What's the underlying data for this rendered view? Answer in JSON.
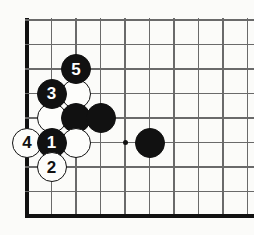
{
  "diagram": {
    "type": "go-board-diagram",
    "board": {
      "background_color": "#fbfbf9",
      "line_color": "#6a6a6a",
      "edge_color": "#111111",
      "origin_x": 27,
      "origin_y": 20,
      "spacing": 24.5,
      "columns": 10,
      "rows": 9,
      "left_edge_is_board_border": true,
      "bottom_edge_is_board_border": true,
      "top_edge_is_board_border": true,
      "star_points": [
        {
          "col": 4,
          "row": 5,
          "label": "hoshi"
        }
      ]
    },
    "stones": [
      {
        "id": "s-white-a",
        "color": "white",
        "label": "",
        "col": 2,
        "row": 3,
        "numbered": false
      },
      {
        "id": "s-white-b",
        "color": "white",
        "label": "",
        "col": 1,
        "row": 4,
        "numbered": false
      },
      {
        "id": "s-black-c",
        "color": "black",
        "label": "",
        "col": 2,
        "row": 4,
        "numbered": false
      },
      {
        "id": "s-black-d",
        "color": "black",
        "label": "",
        "col": 3,
        "row": 4,
        "numbered": false
      },
      {
        "id": "s-white-e",
        "color": "white",
        "label": "",
        "col": 2,
        "row": 5,
        "numbered": false
      },
      {
        "id": "s-black-f",
        "color": "black",
        "label": "",
        "col": 5,
        "row": 5,
        "numbered": false
      },
      {
        "id": "move-3",
        "color": "black",
        "label": "3",
        "col": 1,
        "row": 3,
        "numbered": true
      },
      {
        "id": "move-5",
        "color": "black",
        "label": "5",
        "col": 2,
        "row": 2,
        "numbered": true
      },
      {
        "id": "move-4",
        "color": "white",
        "label": "4",
        "col": 0,
        "row": 5,
        "numbered": true
      },
      {
        "id": "move-1",
        "color": "black",
        "label": "1",
        "col": 1,
        "row": 5,
        "numbered": true
      },
      {
        "id": "move-2",
        "color": "white",
        "label": "2",
        "col": 1,
        "row": 6,
        "numbered": true
      }
    ],
    "move_sequence": [
      "1",
      "2",
      "3",
      "4",
      "5"
    ]
  }
}
